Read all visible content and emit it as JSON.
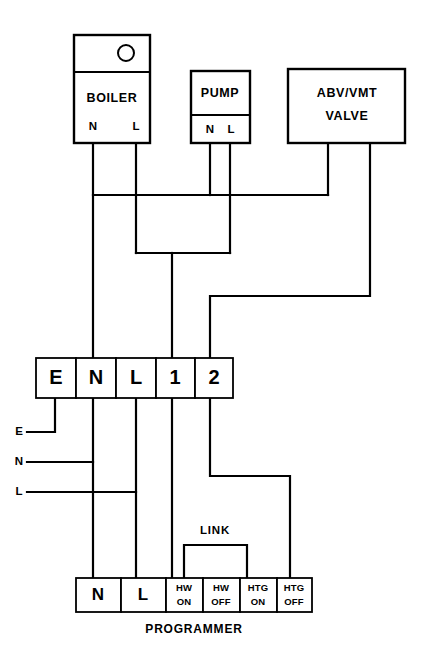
{
  "diagram": {
    "caption": "PROGRAMMER",
    "colors": {
      "line": "#000000",
      "background": "#ffffff"
    },
    "units": [
      {
        "id": "boiler",
        "label": "BOILER",
        "has_indicator_lamp": true,
        "terminals": [
          "N",
          "L"
        ]
      },
      {
        "id": "pump",
        "label": "PUMP",
        "has_indicator_lamp": false,
        "terminals": [
          "N",
          "L"
        ]
      },
      {
        "id": "valve",
        "label_line1": "ABV/VMT",
        "label_line2": "VALVE",
        "has_indicator_lamp": false,
        "terminals": []
      }
    ],
    "terminal_strip": {
      "name": "terminal-strip",
      "cells": [
        "E",
        "N",
        "L",
        "1",
        "2"
      ]
    },
    "supply_labels": [
      "E",
      "N",
      "L"
    ],
    "link": {
      "label": "LINK"
    },
    "programmer": {
      "caption": "PROGRAMMER",
      "cells": [
        {
          "line1": "N",
          "line2": "",
          "size": "big"
        },
        {
          "line1": "L",
          "line2": "",
          "size": "big"
        },
        {
          "line1": "HW",
          "line2": "ON",
          "size": "small"
        },
        {
          "line1": "HW",
          "line2": "OFF",
          "size": "small"
        },
        {
          "line1": "HTG",
          "line2": "ON",
          "size": "small"
        },
        {
          "line1": "HTG",
          "line2": "OFF",
          "size": "small"
        }
      ]
    }
  }
}
